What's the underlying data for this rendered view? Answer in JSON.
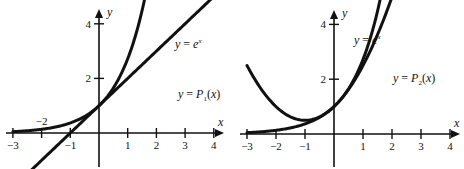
{
  "chart_data": [
    {
      "type": "line",
      "title": "",
      "xlabel": "x",
      "ylabel": "y",
      "xlim": [
        -3,
        4
      ],
      "ylim": [
        -2,
        8
      ],
      "x_ticks": [
        -3,
        -2,
        -1,
        1,
        2,
        3,
        4
      ],
      "y_ticks": [
        -2,
        2,
        4,
        6,
        8
      ],
      "x_tick_labels": [
        "−3",
        "−2",
        "−1",
        "1",
        "2",
        "3",
        "4"
      ],
      "y_tick_labels": [
        "−2",
        "2",
        "4",
        "6",
        "8"
      ],
      "grid": false,
      "series": [
        {
          "name": "y = e^x",
          "function": "exp(x)",
          "x_range": [
            -3,
            2.08
          ],
          "label_main": "y = e",
          "label_sup": "x"
        },
        {
          "name": "y = P1(x)",
          "function": "1 + x",
          "x_range": [
            -3,
            4
          ],
          "label_main": "y = P",
          "label_sub": "1",
          "label_tail": "(x)"
        }
      ],
      "annotations": [
        "y = e^x",
        "y = P₁(x)"
      ]
    },
    {
      "type": "line",
      "title": "",
      "xlabel": "x",
      "ylabel": "y",
      "xlim": [
        -3,
        4
      ],
      "ylim": [
        -2,
        8
      ],
      "x_ticks": [
        -3,
        -2,
        -1,
        1,
        2,
        3,
        4
      ],
      "y_ticks": [
        -2,
        2,
        4,
        6,
        8
      ],
      "x_tick_labels": [
        "−3",
        "−2",
        "−1",
        "1",
        "2",
        "3",
        "4"
      ],
      "y_tick_labels": [
        "−2",
        "2",
        "4",
        "6",
        "8"
      ],
      "grid": false,
      "series": [
        {
          "name": "y = e^x",
          "function": "exp(x)",
          "x_range": [
            -3,
            2.08
          ],
          "label_main": "y = e",
          "label_sup": "x"
        },
        {
          "name": "y = P2(x)",
          "function": "1 + x + x^2/2",
          "x_range": [
            -3,
            2.87
          ],
          "label_main": "y = P",
          "label_sub": "2",
          "label_tail": "(x)"
        }
      ],
      "annotations": [
        "y = e^x",
        "y = P₂(x)"
      ]
    }
  ]
}
